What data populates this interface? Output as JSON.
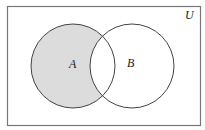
{
  "diagram": {
    "type": "venn",
    "universe_label": "U",
    "sets": [
      {
        "name": "A",
        "label": "A"
      },
      {
        "name": "B",
        "label": "B"
      }
    ],
    "shaded_region": "A minus B",
    "colors": {
      "shade": "#dcdcdc",
      "stroke": "#444444",
      "border": "#777777"
    }
  }
}
